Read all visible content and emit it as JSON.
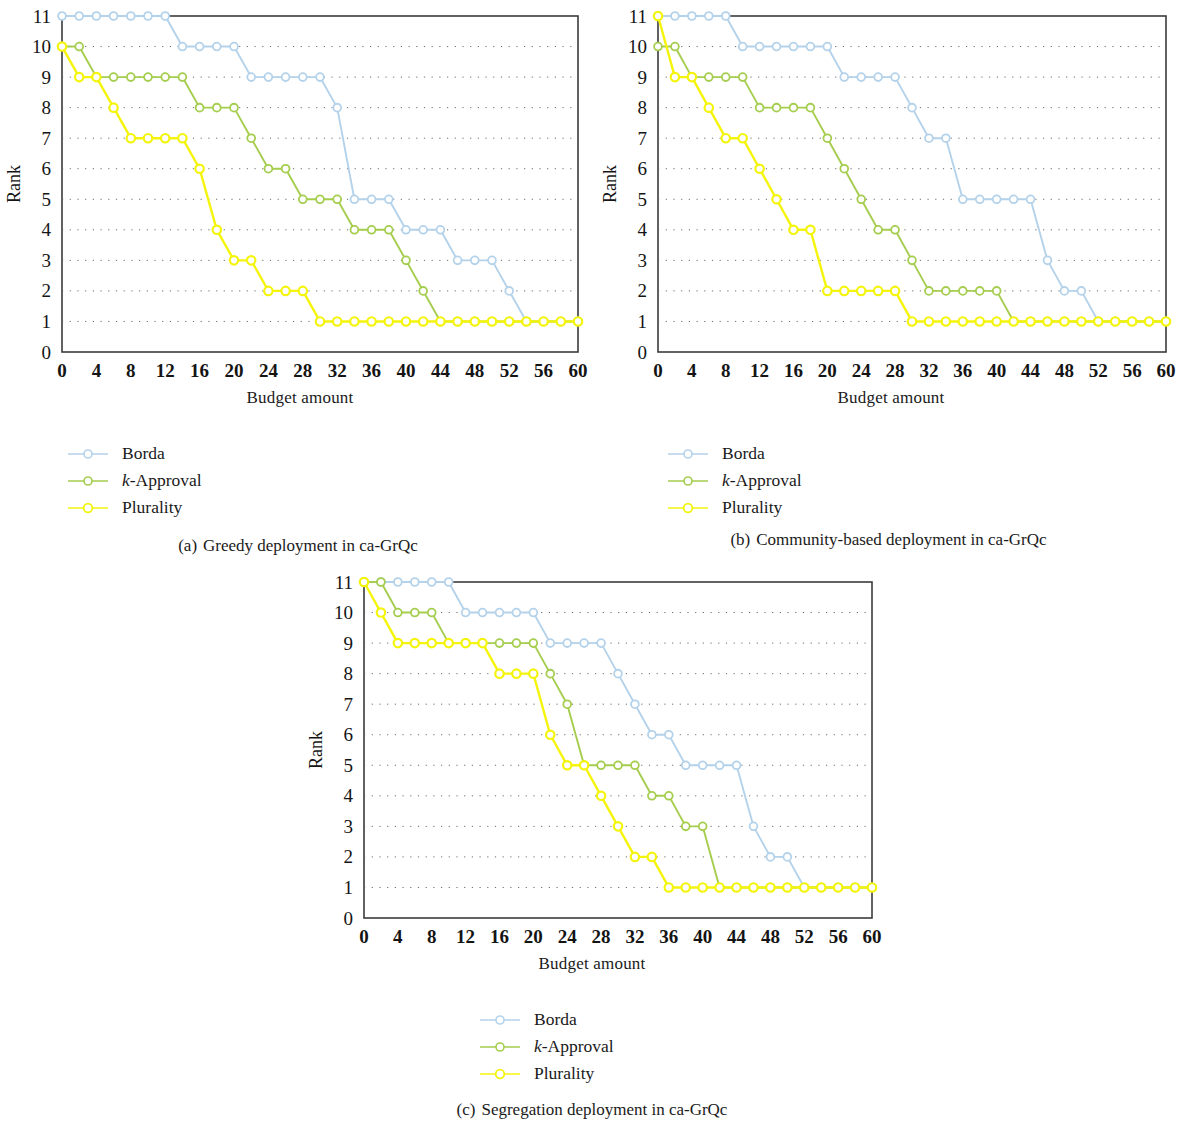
{
  "figure": {
    "y_axis_label": "Rank",
    "x_axis_label": "Budget amount",
    "y_ticks": [
      "0",
      "1",
      "2",
      "3",
      "4",
      "5",
      "6",
      "7",
      "8",
      "9",
      "10",
      "11"
    ],
    "x_ticks": [
      "0",
      "4",
      "8",
      "12",
      "16",
      "20",
      "24",
      "28",
      "32",
      "36",
      "40",
      "44",
      "48",
      "52",
      "56",
      "60"
    ],
    "colors": {
      "borda": "#b4d2ea",
      "k_approval": "#a5cd4e",
      "plurality": "#f4f40c",
      "axis": "#3b3b3b",
      "grid": "#6b6b6b"
    },
    "legend": {
      "borda": "Borda",
      "k_approval_italic": "k",
      "k_approval_rest": "-Approval",
      "plurality": "Plurality"
    },
    "captions": {
      "a_num": "(a)",
      "a_text": "Greedy deployment in ca-GrQc",
      "b_num": "(b)",
      "b_text": "Community-based deployment in ca-GrQc",
      "c_num": "(c)",
      "c_text": "Segregation deployment in ca-GrQc"
    }
  },
  "chart_data": [
    {
      "type": "line",
      "panel": "a",
      "title": "(a) Greedy deployment in ca-GrQc",
      "xlabel": "Budget amount",
      "ylabel": "Rank",
      "xlim": [
        0,
        60
      ],
      "ylim": [
        0,
        11
      ],
      "grid": true,
      "legend_position": "below-left",
      "x": [
        0,
        2,
        4,
        6,
        8,
        10,
        12,
        14,
        16,
        18,
        20,
        22,
        24,
        26,
        28,
        30,
        32,
        34,
        36,
        38,
        40,
        42,
        44,
        46,
        48,
        50,
        52,
        54,
        56,
        58,
        60
      ],
      "series": [
        {
          "name": "Borda",
          "color": "#b4d2ea",
          "values": [
            11,
            11,
            11,
            11,
            11,
            11,
            11,
            10,
            10,
            10,
            10,
            9,
            9,
            9,
            9,
            9,
            8,
            5,
            5,
            5,
            4,
            4,
            4,
            3,
            3,
            3,
            2,
            1,
            1,
            1,
            1
          ]
        },
        {
          "name": "k-Approval",
          "color": "#a5cd4e",
          "values": [
            10,
            10,
            9,
            9,
            9,
            9,
            9,
            9,
            8,
            8,
            8,
            7,
            6,
            6,
            5,
            5,
            5,
            4,
            4,
            4,
            3,
            2,
            1,
            1,
            1,
            1,
            1,
            1,
            1,
            1,
            1
          ]
        },
        {
          "name": "Plurality",
          "color": "#f4f40c",
          "values": [
            10,
            9,
            9,
            8,
            7,
            7,
            7,
            7,
            6,
            4,
            3,
            3,
            2,
            2,
            2,
            1,
            1,
            1,
            1,
            1,
            1,
            1,
            1,
            1,
            1,
            1,
            1,
            1,
            1,
            1,
            1
          ]
        }
      ]
    },
    {
      "type": "line",
      "panel": "b",
      "title": "(b) Community-based deployment in ca-GrQc",
      "xlabel": "Budget amount",
      "ylabel": "Rank",
      "xlim": [
        0,
        60
      ],
      "ylim": [
        0,
        11
      ],
      "grid": true,
      "legend_position": "below-left",
      "x": [
        0,
        2,
        4,
        6,
        8,
        10,
        12,
        14,
        16,
        18,
        20,
        22,
        24,
        26,
        28,
        30,
        32,
        34,
        36,
        38,
        40,
        42,
        44,
        46,
        48,
        50,
        52,
        54,
        56,
        58,
        60
      ],
      "series": [
        {
          "name": "Borda",
          "color": "#b4d2ea",
          "values": [
            11,
            11,
            11,
            11,
            11,
            10,
            10,
            10,
            10,
            10,
            10,
            9,
            9,
            9,
            9,
            8,
            7,
            7,
            5,
            5,
            5,
            5,
            5,
            3,
            2,
            2,
            1,
            1,
            1,
            1,
            1
          ]
        },
        {
          "name": "k-Approval",
          "color": "#a5cd4e",
          "values": [
            10,
            10,
            9,
            9,
            9,
            9,
            8,
            8,
            8,
            8,
            7,
            6,
            5,
            4,
            4,
            3,
            2,
            2,
            2,
            2,
            2,
            1,
            1,
            1,
            1,
            1,
            1,
            1,
            1,
            1,
            1
          ]
        },
        {
          "name": "Plurality",
          "color": "#f4f40c",
          "values": [
            11,
            9,
            9,
            8,
            7,
            7,
            6,
            5,
            4,
            4,
            2,
            2,
            2,
            2,
            2,
            1,
            1,
            1,
            1,
            1,
            1,
            1,
            1,
            1,
            1,
            1,
            1,
            1,
            1,
            1,
            1
          ]
        }
      ]
    },
    {
      "type": "line",
      "panel": "c",
      "title": "(c) Segregation deployment in ca-GrQc",
      "xlabel": "Budget amount",
      "ylabel": "Rank",
      "xlim": [
        0,
        60
      ],
      "ylim": [
        0,
        11
      ],
      "grid": true,
      "legend_position": "below-center",
      "x": [
        0,
        2,
        4,
        6,
        8,
        10,
        12,
        14,
        16,
        18,
        20,
        22,
        24,
        26,
        28,
        30,
        32,
        34,
        36,
        38,
        40,
        42,
        44,
        46,
        48,
        50,
        52,
        54,
        56,
        58,
        60
      ],
      "series": [
        {
          "name": "Borda",
          "color": "#b4d2ea",
          "values": [
            11,
            11,
            11,
            11,
            11,
            11,
            10,
            10,
            10,
            10,
            10,
            9,
            9,
            9,
            9,
            8,
            7,
            6,
            6,
            5,
            5,
            5,
            5,
            3,
            2,
            2,
            1,
            1,
            1,
            1,
            1
          ]
        },
        {
          "name": "k-Approval",
          "color": "#a5cd4e",
          "values": [
            11,
            11,
            10,
            10,
            10,
            9,
            9,
            9,
            9,
            9,
            9,
            8,
            7,
            5,
            5,
            5,
            5,
            4,
            4,
            3,
            3,
            1,
            1,
            1,
            1,
            1,
            1,
            1,
            1,
            1,
            1
          ]
        },
        {
          "name": "Plurality",
          "color": "#f4f40c",
          "values": [
            11,
            10,
            9,
            9,
            9,
            9,
            9,
            9,
            8,
            8,
            8,
            6,
            5,
            5,
            4,
            3,
            2,
            2,
            1,
            1,
            1,
            1,
            1,
            1,
            1,
            1,
            1,
            1,
            1,
            1,
            1
          ]
        }
      ]
    }
  ]
}
